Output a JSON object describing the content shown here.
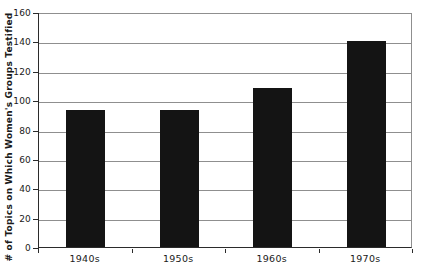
{
  "chart_data": {
    "type": "bar",
    "title": "",
    "xlabel": "",
    "ylabel": "# of Topics on Which Women's Groups Testified",
    "categories": [
      "1940s",
      "1950s",
      "1960s",
      "1970s"
    ],
    "values": [
      93,
      93,
      108,
      140
    ],
    "ylim": [
      0,
      160
    ],
    "yticks": [
      0,
      20,
      40,
      60,
      80,
      100,
      120,
      140,
      160
    ],
    "grid": "horizontal",
    "legend": "none",
    "colors": {
      "bar": "#141414",
      "gridline": "#8f8f8f",
      "axis": "#2b2b2b",
      "text": "#1a1a1a",
      "background": "#ffffff"
    }
  }
}
